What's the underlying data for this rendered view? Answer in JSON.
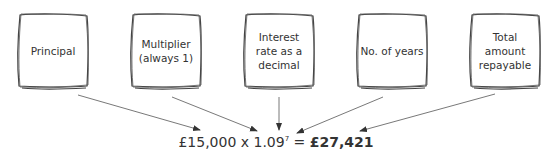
{
  "boxes": [
    {
      "label": "Principal"
    },
    {
      "label": "Multiplier (always 1)"
    },
    {
      "label": "Interest rate as a decimal"
    },
    {
      "label": "No. of years"
    },
    {
      "label": "Total amount repayable"
    }
  ],
  "formula": {
    "principal": "£15,000",
    "operator": " x ",
    "base": "1.09",
    "exponent": "7",
    "equals": " = ",
    "result": "£27,421"
  },
  "colors": {
    "stroke": "#444444",
    "text": "#333333"
  }
}
